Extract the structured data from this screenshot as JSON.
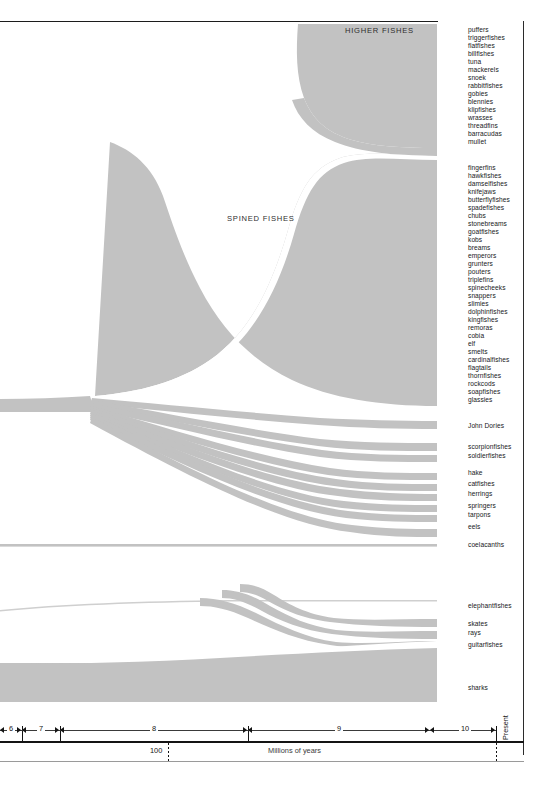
{
  "figure": {
    "background": "#ffffff",
    "flow_color": "#c2c2c2",
    "flow_color_light": "#d8d8d8",
    "rule_color": "#1c1c1c"
  },
  "flow_captions": {
    "higher_fishes": "HIGHER FISHES",
    "spined_fishes": "SPINED FISHES"
  },
  "axis": {
    "unit_label": "Millions of years",
    "present_label": "Present",
    "hundred_label": "100",
    "segments": [
      {
        "label": "6",
        "x_start": 0,
        "x_end": 22
      },
      {
        "label": "7",
        "x_start": 22,
        "x_end": 60
      },
      {
        "label": "8",
        "x_start": 60,
        "x_end": 248
      },
      {
        "label": "9",
        "x_start": 248,
        "x_end": 430
      },
      {
        "label": "10",
        "x_start": 430,
        "x_end": 496
      }
    ],
    "ticks_x": [
      22,
      60,
      248,
      496
    ],
    "hundred_x": 168
  },
  "chart_data": {
    "type": "area",
    "xlabel": "Millions of years",
    "ylabel": "",
    "x_axis_segments": [
      "6",
      "7",
      "8",
      "9",
      "10",
      "Present"
    ],
    "groups": [
      {
        "name": "HIGHER FISHES",
        "caption_x": 345,
        "caption_y": 26,
        "taxa": [
          "puffers",
          "triggerfishes",
          "flatfishes",
          "billfishes",
          "tuna",
          "mackerels",
          "snoek",
          "rabbitfishes",
          "gobies",
          "blennies",
          "klipfishes",
          "wrasses",
          "threadfins",
          "barracudas",
          "mullet"
        ]
      },
      {
        "name": "SPINED FISHES",
        "caption_x": 227,
        "caption_y": 214,
        "taxa": [
          "fingerfins",
          "hawkfishes",
          "damselfishes",
          "knifejaws",
          "butterflyfishes",
          "spadefishes",
          "chubs",
          "stonebreams",
          "goatfishes",
          "kobs",
          "breams",
          "emperors",
          "grunters",
          "pouters",
          "triplefins",
          "spinecheeks",
          "snappers",
          "slimies",
          "dolphinfishes",
          "kingfishes",
          "remoras",
          "cobia",
          "elf",
          "smelts",
          "cardinalfishes",
          "flagtails",
          "thornfishes",
          "rockcods",
          "soapfishes",
          "glassies"
        ]
      },
      {
        "name": "minor ray-finned branches",
        "taxa": [
          "John Dories",
          "scorpionfishes",
          "soldierfishes",
          "hake",
          "catfishes",
          "herrings",
          "springers",
          "tarpons",
          "eels"
        ]
      },
      {
        "name": "lobe-finned",
        "taxa": [
          "coelacanths"
        ]
      },
      {
        "name": "cartilaginous & other",
        "taxa": [
          "elephantfishes",
          "skates",
          "rays",
          "guitarfishes",
          "sharks"
        ]
      }
    ],
    "labels": [
      {
        "text": "puffers",
        "y": 30
      },
      {
        "text": "triggerfishes",
        "y": 38
      },
      {
        "text": "flatfishes",
        "y": 46
      },
      {
        "text": "billfishes",
        "y": 54
      },
      {
        "text": "tuna",
        "y": 62
      },
      {
        "text": "mackerels",
        "y": 70
      },
      {
        "text": "snoek",
        "y": 78
      },
      {
        "text": "rabbitfishes",
        "y": 86
      },
      {
        "text": "gobies",
        "y": 94
      },
      {
        "text": "blennies",
        "y": 102
      },
      {
        "text": "klipfishes",
        "y": 110
      },
      {
        "text": "wrasses",
        "y": 118
      },
      {
        "text": "threadfins",
        "y": 126
      },
      {
        "text": "barracudas",
        "y": 134
      },
      {
        "text": "mullet",
        "y": 142
      },
      {
        "text": "fingerfins",
        "y": 168
      },
      {
        "text": "hawkfishes",
        "y": 176
      },
      {
        "text": "damselfishes",
        "y": 184
      },
      {
        "text": "knifejaws",
        "y": 192
      },
      {
        "text": "butterflyfishes",
        "y": 200
      },
      {
        "text": "spadefishes",
        "y": 208
      },
      {
        "text": "chubs",
        "y": 216
      },
      {
        "text": "stonebreams",
        "y": 224
      },
      {
        "text": "goatfishes",
        "y": 232
      },
      {
        "text": "kobs",
        "y": 240
      },
      {
        "text": "breams",
        "y": 248
      },
      {
        "text": "emperors",
        "y": 256
      },
      {
        "text": "grunters",
        "y": 264
      },
      {
        "text": "pouters",
        "y": 272
      },
      {
        "text": "triplefins",
        "y": 280
      },
      {
        "text": "spinecheeks",
        "y": 288
      },
      {
        "text": "snappers",
        "y": 296
      },
      {
        "text": "slimies",
        "y": 304
      },
      {
        "text": "dolphinfishes",
        "y": 312
      },
      {
        "text": "kingfishes",
        "y": 320
      },
      {
        "text": "remoras",
        "y": 328
      },
      {
        "text": "cobia",
        "y": 336
      },
      {
        "text": "elf",
        "y": 344
      },
      {
        "text": "smelts",
        "y": 352
      },
      {
        "text": "cardinalfishes",
        "y": 360
      },
      {
        "text": "flagtails",
        "y": 368
      },
      {
        "text": "thornfishes",
        "y": 376
      },
      {
        "text": "rockcods",
        "y": 384
      },
      {
        "text": "soapfishes",
        "y": 392
      },
      {
        "text": "glassies",
        "y": 400
      },
      {
        "text": "John Dories",
        "y": 426
      },
      {
        "text": "scorpionfishes",
        "y": 447
      },
      {
        "text": "soldierfishes",
        "y": 456
      },
      {
        "text": "hake",
        "y": 473
      },
      {
        "text": "catfishes",
        "y": 484
      },
      {
        "text": "herrings",
        "y": 494
      },
      {
        "text": "springers",
        "y": 506
      },
      {
        "text": "tarpons",
        "y": 515
      },
      {
        "text": "eels",
        "y": 527
      },
      {
        "text": "coelacanths",
        "y": 545
      },
      {
        "text": "elephantfishes",
        "y": 606
      },
      {
        "text": "skates",
        "y": 624
      },
      {
        "text": "rays",
        "y": 633
      },
      {
        "text": "guitarfishes",
        "y": 645
      },
      {
        "text": "sharks",
        "y": 688
      }
    ],
    "bands": [
      {
        "name": "higher-fishes-mass",
        "top_at_present": 26,
        "bottom_at_present": 148,
        "onset_x": 300
      },
      {
        "name": "spined-fishes-mass",
        "top_at_present": 160,
        "bottom_at_present": 406,
        "onset_x": 170
      },
      {
        "name": "john-dories",
        "top_at_present": 421,
        "bottom_at_present": 429,
        "onset_x": 95
      },
      {
        "name": "scorpionfishes",
        "top_at_present": 442,
        "bottom_at_present": 450,
        "onset_x": 95
      },
      {
        "name": "soldierfishes",
        "top_at_present": 452,
        "bottom_at_present": 460,
        "onset_x": 95
      },
      {
        "name": "hake",
        "top_at_present": 469,
        "bottom_at_present": 476,
        "onset_x": 95
      },
      {
        "name": "catfishes",
        "top_at_present": 480,
        "bottom_at_present": 487,
        "onset_x": 95
      },
      {
        "name": "herrings",
        "top_at_present": 490,
        "bottom_at_present": 497,
        "onset_x": 95
      },
      {
        "name": "springers",
        "top_at_present": 502,
        "bottom_at_present": 509,
        "onset_x": 95
      },
      {
        "name": "tarpons",
        "top_at_present": 511,
        "bottom_at_present": 518,
        "onset_x": 95
      },
      {
        "name": "eels",
        "top_at_present": 522,
        "bottom_at_present": 531,
        "onset_x": 95
      },
      {
        "name": "coelacanths",
        "top_at_present": 543,
        "bottom_at_present": 546,
        "onset_x": 0
      },
      {
        "name": "elephantfishes",
        "top_at_present": 604,
        "bottom_at_present": 606,
        "onset_x": 0
      },
      {
        "name": "skates",
        "top_at_present": 619,
        "bottom_at_present": 627,
        "onset_x": 260
      },
      {
        "name": "rays",
        "top_at_present": 630,
        "bottom_at_present": 638,
        "onset_x": 260
      },
      {
        "name": "guitarfishes",
        "top_at_present": 641,
        "bottom_at_present": 650,
        "onset_x": 300
      },
      {
        "name": "sharks",
        "top_at_present": 665,
        "bottom_at_present": 700,
        "onset_x": 0
      }
    ]
  }
}
